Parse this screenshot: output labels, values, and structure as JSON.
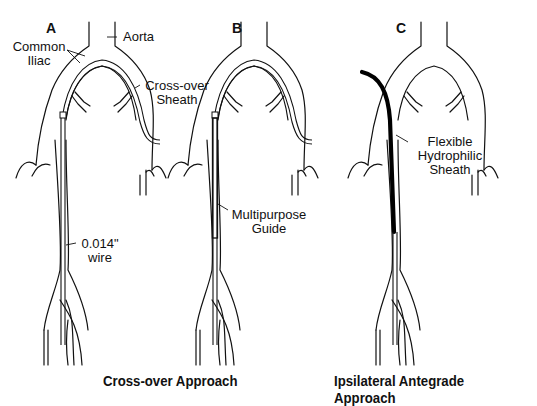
{
  "panels": [
    {
      "letter": "A",
      "labels": {
        "common_iliac_1": "Common",
        "common_iliac_2": "Iliac",
        "aorta": "Aorta",
        "sheath_1": "Cross-over",
        "sheath_2": "Sheath",
        "wire_1": "0.014\"",
        "wire_2": "wire"
      }
    },
    {
      "letter": "B",
      "labels": {
        "guide_1": "Multipurpose",
        "guide_2": "Guide"
      }
    },
    {
      "letter": "C",
      "labels": {
        "flex_1": "Flexible",
        "flex_2": "Hydrophilic",
        "flex_3": "Sheath"
      }
    }
  ],
  "captions": {
    "crossover": "Cross-over Approach",
    "ipsilateral": "Ipsilateral Antegrade Approach"
  },
  "colors": {
    "line": "#111111",
    "background": "#ffffff"
  }
}
